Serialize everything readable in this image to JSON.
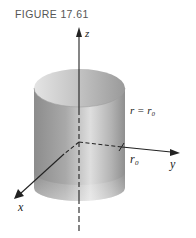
{
  "figure": {
    "title": "FIGURE 17.61"
  },
  "diagram": {
    "type": "3d-cylinder",
    "axes": {
      "z_label": "z",
      "y_label": "y",
      "x_label": "x"
    },
    "equation_label": "r = r₀",
    "radius_label": "r₀",
    "colors": {
      "surface_dark": "#8a8a8a",
      "surface_light": "#d8d8d8",
      "axis": "#222222"
    }
  }
}
